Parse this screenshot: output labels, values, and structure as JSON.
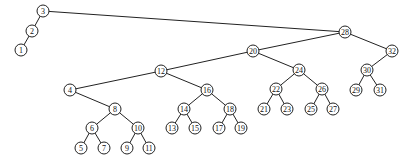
{
  "diagram": {
    "type": "binary-search-tree",
    "root": "3",
    "node_radius": 6,
    "colors": {
      "stroke": "#222222",
      "fill": "#ffffff",
      "text": "#111111",
      "background": "#ffffff"
    },
    "nodes": [
      {
        "id": "3",
        "label": "3",
        "x": 43,
        "y": 11
      },
      {
        "id": "2",
        "label": "2",
        "x": 32,
        "y": 31
      },
      {
        "id": "1",
        "label": "1",
        "x": 21,
        "y": 50
      },
      {
        "id": "28",
        "label": "28",
        "x": 345,
        "y": 32
      },
      {
        "id": "20",
        "label": "20",
        "x": 253,
        "y": 51
      },
      {
        "id": "32",
        "label": "32",
        "x": 392,
        "y": 51
      },
      {
        "id": "30",
        "label": "30",
        "x": 367,
        "y": 70
      },
      {
        "id": "29",
        "label": "29",
        "x": 356,
        "y": 90
      },
      {
        "id": "31",
        "label": "31",
        "x": 380,
        "y": 90
      },
      {
        "id": "12",
        "label": "12",
        "x": 161,
        "y": 71
      },
      {
        "id": "24",
        "label": "24",
        "x": 299,
        "y": 70
      },
      {
        "id": "22",
        "label": "22",
        "x": 276,
        "y": 89
      },
      {
        "id": "26",
        "label": "26",
        "x": 322,
        "y": 89
      },
      {
        "id": "21",
        "label": "21",
        "x": 264,
        "y": 109
      },
      {
        "id": "23",
        "label": "23",
        "x": 287,
        "y": 109
      },
      {
        "id": "25",
        "label": "25",
        "x": 311,
        "y": 109
      },
      {
        "id": "27",
        "label": "27",
        "x": 333,
        "y": 109
      },
      {
        "id": "4",
        "label": "4",
        "x": 70,
        "y": 90
      },
      {
        "id": "16",
        "label": "16",
        "x": 207,
        "y": 90
      },
      {
        "id": "8",
        "label": "8",
        "x": 115,
        "y": 109
      },
      {
        "id": "14",
        "label": "14",
        "x": 184,
        "y": 109
      },
      {
        "id": "18",
        "label": "18",
        "x": 230,
        "y": 109
      },
      {
        "id": "6",
        "label": "6",
        "x": 92,
        "y": 128
      },
      {
        "id": "10",
        "label": "10",
        "x": 138,
        "y": 128
      },
      {
        "id": "13",
        "label": "13",
        "x": 172,
        "y": 128
      },
      {
        "id": "15",
        "label": "15",
        "x": 195,
        "y": 128
      },
      {
        "id": "17",
        "label": "17",
        "x": 219,
        "y": 128
      },
      {
        "id": "19",
        "label": "19",
        "x": 241,
        "y": 128
      },
      {
        "id": "5",
        "label": "5",
        "x": 81,
        "y": 148
      },
      {
        "id": "7",
        "label": "7",
        "x": 104,
        "y": 148
      },
      {
        "id": "9",
        "label": "9",
        "x": 127,
        "y": 148
      },
      {
        "id": "11",
        "label": "11",
        "x": 149,
        "y": 148
      }
    ],
    "edges": [
      [
        "3",
        "2"
      ],
      [
        "2",
        "1"
      ],
      [
        "3",
        "28"
      ],
      [
        "28",
        "20"
      ],
      [
        "28",
        "32"
      ],
      [
        "32",
        "30"
      ],
      [
        "30",
        "29"
      ],
      [
        "30",
        "31"
      ],
      [
        "20",
        "12"
      ],
      [
        "20",
        "24"
      ],
      [
        "24",
        "22"
      ],
      [
        "24",
        "26"
      ],
      [
        "22",
        "21"
      ],
      [
        "22",
        "23"
      ],
      [
        "26",
        "25"
      ],
      [
        "26",
        "27"
      ],
      [
        "12",
        "4"
      ],
      [
        "12",
        "16"
      ],
      [
        "4",
        "8"
      ],
      [
        "8",
        "6"
      ],
      [
        "8",
        "10"
      ],
      [
        "6",
        "5"
      ],
      [
        "6",
        "7"
      ],
      [
        "10",
        "9"
      ],
      [
        "10",
        "11"
      ],
      [
        "16",
        "14"
      ],
      [
        "16",
        "18"
      ],
      [
        "14",
        "13"
      ],
      [
        "14",
        "15"
      ],
      [
        "18",
        "17"
      ],
      [
        "18",
        "19"
      ]
    ]
  }
}
